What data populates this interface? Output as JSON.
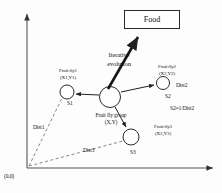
{
  "figure": {
    "background_color": "#fdfdfd",
    "stroke_color": "#2a2a2a",
    "dash_color": "#555555"
  },
  "axes": {
    "origin_label": "(0,0)",
    "vertical_axis_name": "y-axis",
    "horizontal_axis_name": "x-axis"
  },
  "food": {
    "label": "Food"
  },
  "evolution": {
    "line1": "Iterative",
    "line2": "evolution"
  },
  "group": {
    "name_line1": "Fruit fly group",
    "name_line2": "(X,Y)"
  },
  "flies": [
    {
      "id": "fly1",
      "name_line1": "Fruit fly1",
      "name_line2": "(X1,Y1)",
      "smell_label": "S1",
      "distance_label": "Dist1"
    },
    {
      "id": "fly2",
      "name_line1": "Fruit fly2",
      "name_line2": "(X2,Y2)",
      "smell_label": "S2",
      "distance_label": "Dist2"
    },
    {
      "id": "fly3",
      "name_line1": "Fruit fly3",
      "name_line2": "(X3,Y3)",
      "smell_label": "S3",
      "distance_label": "Dist3"
    }
  ],
  "formula": {
    "text": "S2=1/Dist2"
  }
}
